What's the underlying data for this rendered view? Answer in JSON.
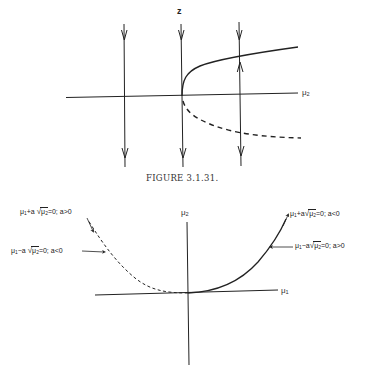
{
  "figure_top": {
    "vertical_axis_label": "z",
    "horizontal_axis_label_base": "μ",
    "horizontal_axis_label_sub": "2",
    "caption": "FIGURE 3.1.31.",
    "curves": [
      {
        "name": "stable-branch",
        "style": "solid"
      },
      {
        "name": "unstable-branch",
        "style": "dashed"
      }
    ],
    "flow_lines": [
      {
        "position": "left",
        "direction": "down"
      },
      {
        "position": "center",
        "direction": "down"
      },
      {
        "position": "right",
        "direction": "toward-solid-branch"
      }
    ]
  },
  "figure_bottom": {
    "vertical_axis_label_base": "μ",
    "vertical_axis_label_sub": "2",
    "horizontal_axis_label_base": "μ",
    "horizontal_axis_label_sub": "1",
    "annotations": [
      {
        "id": "top-left",
        "pre": "μ",
        "pre_sub": "1",
        "op": "+a ",
        "rad": "μ",
        "rad_sub": "2",
        "post": "=0; a>0"
      },
      {
        "id": "mid-left",
        "pre": "μ",
        "pre_sub": "1",
        "op": "−a ",
        "rad": "μ",
        "rad_sub": "2",
        "post": "=0; a<0"
      },
      {
        "id": "top-right",
        "pre": "μ",
        "pre_sub": "1",
        "op": "+a",
        "rad": "μ",
        "rad_sub": "2",
        "post": "=0; a<0"
      },
      {
        "id": "mid-right",
        "pre": "μ",
        "pre_sub": "1",
        "op": "−a",
        "rad": "μ",
        "rad_sub": "2",
        "post": "=0; a>0"
      }
    ],
    "curves": [
      {
        "name": "left-branch",
        "style": "dashed"
      },
      {
        "name": "right-branch",
        "style": "solid"
      }
    ]
  },
  "colors": {
    "ink": "#222222",
    "background": "#ffffff"
  }
}
